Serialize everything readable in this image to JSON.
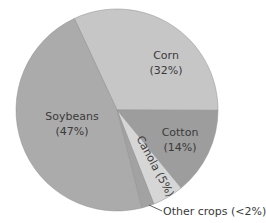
{
  "chart_data": {
    "type": "pie",
    "title": "",
    "slices": [
      {
        "label": "Corn",
        "value": 32,
        "display": "(32%)",
        "color": "#c6c6c6"
      },
      {
        "label": "Cotton",
        "value": 14,
        "display": "(14%)",
        "color": "#9d9d9d"
      },
      {
        "label": "Canola",
        "value": 5,
        "display": "Canola (5%)",
        "color": "#d6d6d6"
      },
      {
        "label": "Other crops",
        "value": 2,
        "display": "Other crops (<2%)",
        "color": "#a2a2a2"
      },
      {
        "label": "Soybeans",
        "value": 47,
        "display": "(47%)",
        "color": "#ababab"
      }
    ],
    "start_angle_deg": -25,
    "legend": "none (direct labels)"
  },
  "labels": {
    "corn_name": "Corn",
    "corn_pct": "(32%)",
    "soy_name": "Soybeans",
    "soy_pct": "(47%)",
    "cotton_name": "Cotton",
    "cotton_pct": "(14%)",
    "canola": "Canola (5%)",
    "other": "Other crops (<2%)"
  }
}
